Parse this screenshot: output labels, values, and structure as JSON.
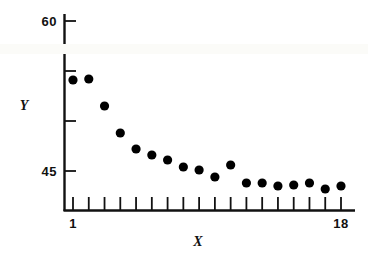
{
  "chart_data": {
    "type": "scatter",
    "title": "",
    "xlabel": "X",
    "ylabel": "Y",
    "x": [
      1,
      2,
      3,
      4,
      5,
      6,
      7,
      8,
      9,
      10,
      11,
      12,
      13,
      14,
      15,
      16,
      17,
      18
    ],
    "values": [
      54.1,
      54.2,
      51.5,
      48.8,
      47.2,
      46.6,
      46.1,
      45.4,
      45.1,
      44.4,
      45.6,
      43.8,
      43.8,
      43.5,
      43.6,
      43.8,
      43.2,
      43.5
    ],
    "y_tick_labels": [
      "60",
      "45"
    ],
    "y_ticks": [
      60,
      55,
      50,
      45
    ],
    "x_tick_labels": [
      "1",
      "18"
    ],
    "x_ticks": [
      1,
      2,
      3,
      4,
      5,
      6,
      7,
      8,
      9,
      10,
      11,
      12,
      13,
      14,
      15,
      16,
      17,
      18
    ],
    "ylim": [
      42.2,
      61.0
    ],
    "xlim": [
      0.3,
      18.7
    ],
    "grid": false,
    "legend": "none",
    "marker_color": "#000000",
    "axis_color": "#111111"
  },
  "axes": {
    "y_label": "Y",
    "x_label": "X",
    "y_top_tick_label": "60",
    "y_bottom_tick_label": "45",
    "x_first_tick_label": "1",
    "x_last_tick_label": "18"
  }
}
